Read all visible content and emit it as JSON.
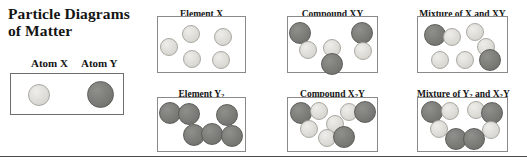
{
  "title": {
    "line1": "Particle Diagrams",
    "line2": "of Matter"
  },
  "key": {
    "atom_x_label": "Atom X",
    "atom_y_label": "Atom Y",
    "particles": [
      {
        "type": "x",
        "x": 28,
        "y": 84,
        "d": 22
      },
      {
        "type": "y",
        "x": 87,
        "y": 81,
        "d": 27
      }
    ]
  },
  "colors": {
    "particle_x_fill": "#dedcd7",
    "particle_x_stroke": "#a9a7a1",
    "particle_y_fill": "#7b7b78",
    "particle_y_stroke": "#5d5d5a",
    "box_stroke": "#8a8a8a",
    "key_box_stroke": "#6d6d6d",
    "rule_stroke": "#4a4a4a",
    "text": "#141414"
  },
  "panels": [
    {
      "name": "element-x",
      "label": "Element X",
      "label_html": "Element X",
      "left": 157,
      "top": 9,
      "width": 89,
      "box_top": 16,
      "box_height": 57,
      "particles": [
        {
          "type": "x",
          "x": 2,
          "y": 21,
          "d": 18
        },
        {
          "type": "x",
          "x": 24,
          "y": 8,
          "d": 18
        },
        {
          "type": "x",
          "x": 56,
          "y": 11,
          "d": 18
        },
        {
          "type": "x",
          "x": 25,
          "y": 33,
          "d": 18
        },
        {
          "type": "x",
          "x": 54,
          "y": 34,
          "d": 18
        }
      ]
    },
    {
      "name": "compound-xy",
      "label": "Compound XY",
      "label_html": "Compound XY",
      "left": 287,
      "top": 9,
      "width": 91,
      "box_top": 16,
      "box_height": 57,
      "particles": [
        {
          "type": "y",
          "x": 1,
          "y": 5,
          "d": 22
        },
        {
          "type": "x",
          "x": 11,
          "y": 24,
          "d": 18
        },
        {
          "type": "x",
          "x": 35,
          "y": 22,
          "d": 18
        },
        {
          "type": "y",
          "x": 33,
          "y": 36,
          "d": 22
        },
        {
          "type": "y",
          "x": 63,
          "y": 5,
          "d": 22
        },
        {
          "type": "x",
          "x": 66,
          "y": 25,
          "d": 18
        }
      ]
    },
    {
      "name": "mixture-x-xy",
      "label": "Mixture of X and XY",
      "label_html": "Mixture of X and XY",
      "left": 417,
      "top": 9,
      "width": 91,
      "box_top": 16,
      "box_height": 57,
      "particles": [
        {
          "type": "y",
          "x": 6,
          "y": 7,
          "d": 22
        },
        {
          "type": "x",
          "x": 25,
          "y": 11,
          "d": 18
        },
        {
          "type": "x",
          "x": 48,
          "y": 6,
          "d": 18
        },
        {
          "type": "x",
          "x": 59,
          "y": 21,
          "d": 18
        },
        {
          "type": "x",
          "x": 13,
          "y": 34,
          "d": 18
        },
        {
          "type": "x",
          "x": 38,
          "y": 34,
          "d": 18
        },
        {
          "type": "y",
          "x": 61,
          "y": 32,
          "d": 22
        }
      ]
    },
    {
      "name": "element-y2",
      "label": "Element Y2",
      "label_html": "Element Y<sub>2</sub>",
      "left": 157,
      "top": 89,
      "width": 89,
      "box_top": 97,
      "box_height": 55,
      "particles": [
        {
          "type": "y",
          "x": 1,
          "y": 4,
          "d": 22
        },
        {
          "type": "y",
          "x": 20,
          "y": 5,
          "d": 22
        },
        {
          "type": "y",
          "x": 58,
          "y": 6,
          "d": 22
        },
        {
          "type": "y",
          "x": 25,
          "y": 26,
          "d": 22
        },
        {
          "type": "y",
          "x": 43,
          "y": 25,
          "d": 22
        },
        {
          "type": "y",
          "x": 63,
          "y": 27,
          "d": 22
        }
      ]
    },
    {
      "name": "compound-x2y",
      "label": "Compound X2Y",
      "label_html": "Compound X<sub>2</sub>Y",
      "left": 287,
      "top": 89,
      "width": 91,
      "box_top": 97,
      "box_height": 55,
      "particles": [
        {
          "type": "y",
          "x": 2,
          "y": 4,
          "d": 22
        },
        {
          "type": "x",
          "x": 22,
          "y": 4,
          "d": 18
        },
        {
          "type": "x",
          "x": 12,
          "y": 22,
          "d": 18
        },
        {
          "type": "x",
          "x": 38,
          "y": 17,
          "d": 18
        },
        {
          "type": "x",
          "x": 52,
          "y": 5,
          "d": 18
        },
        {
          "type": "y",
          "x": 66,
          "y": 3,
          "d": 22
        },
        {
          "type": "x",
          "x": 30,
          "y": 31,
          "d": 18
        },
        {
          "type": "y",
          "x": 45,
          "y": 28,
          "d": 22
        }
      ]
    },
    {
      "name": "mixture-y2-x2y",
      "label": "Mixture of Y2 and X2Y",
      "label_html": "Mixture of Y<sub>2</sub> and X<sub>2</sub>Y",
      "left": 417,
      "top": 89,
      "width": 91,
      "box_top": 97,
      "box_height": 55,
      "particles": [
        {
          "type": "y",
          "x": 3,
          "y": 3,
          "d": 22
        },
        {
          "type": "x",
          "x": 23,
          "y": 4,
          "d": 18
        },
        {
          "type": "x",
          "x": 49,
          "y": 3,
          "d": 18
        },
        {
          "type": "y",
          "x": 63,
          "y": 4,
          "d": 22
        },
        {
          "type": "x",
          "x": 12,
          "y": 22,
          "d": 18
        },
        {
          "type": "x",
          "x": 64,
          "y": 23,
          "d": 18
        },
        {
          "type": "y",
          "x": 27,
          "y": 30,
          "d": 22
        },
        {
          "type": "y",
          "x": 45,
          "y": 30,
          "d": 22
        }
      ]
    }
  ]
}
